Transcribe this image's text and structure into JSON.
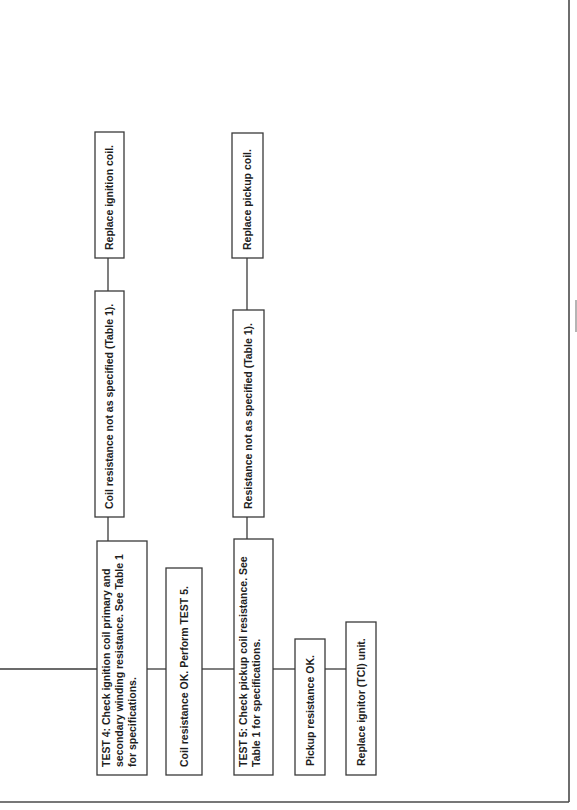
{
  "diagram": {
    "orientation": "rotated-90-ccw",
    "nodes": {
      "test4": {
        "lines": [
          "TEST 4: Check ignition coil primary and",
          "secondary winding resistance. See Table 1",
          "for specifications."
        ]
      },
      "coil_not_spec": {
        "lines": [
          "Coil resistance not as specified (Table 1)."
        ]
      },
      "replace_ignition_coil": {
        "lines": [
          "Replace ignition coil."
        ]
      },
      "coil_ok": {
        "lines": [
          "Coil resistance OK. Perform TEST 5."
        ]
      },
      "test5": {
        "lines": [
          "TEST 5: Check pickup coil resistance. See",
          "Table 1 for specifications."
        ]
      },
      "resistance_not_spec": {
        "lines": [
          "Resistance not as specified (Table 1)."
        ]
      },
      "replace_pickup_coil": {
        "lines": [
          "Replace pickup coil."
        ]
      },
      "pickup_ok": {
        "lines": [
          "Pickup resistance OK."
        ]
      },
      "replace_ignitor": {
        "lines": [
          "Replace ignitor (TCI) unit."
        ]
      }
    },
    "edges": [
      [
        "entry",
        "test4"
      ],
      [
        "test4",
        "coil_not_spec"
      ],
      [
        "coil_not_spec",
        "replace_ignition_coil"
      ],
      [
        "test4",
        "coil_ok"
      ],
      [
        "coil_ok",
        "test5"
      ],
      [
        "test5",
        "resistance_not_spec"
      ],
      [
        "resistance_not_spec",
        "replace_pickup_coil"
      ],
      [
        "test5",
        "pickup_ok"
      ],
      [
        "pickup_ok",
        "replace_ignitor"
      ]
    ],
    "colors": {
      "stroke": "#3a3a3a",
      "text": "#1e1e1e",
      "background": "#ffffff"
    }
  }
}
